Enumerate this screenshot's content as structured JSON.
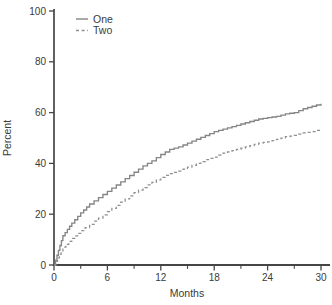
{
  "figure": {
    "ylabel": "Percent",
    "xlabel": "Months"
  },
  "colors": {
    "background": "#ffffff",
    "axis": "#454545",
    "text": "#3a3a3a",
    "series_one": "#858585",
    "series_two": "#8f8f8f"
  },
  "chart_data": {
    "type": "line",
    "title": "",
    "xlabel": "Months",
    "ylabel": "Percent",
    "xlim": [
      0,
      30
    ],
    "ylim": [
      0,
      100
    ],
    "xticks_major": [
      0,
      6,
      12,
      18,
      24,
      30
    ],
    "xticks_minor": [
      3,
      9,
      15,
      21,
      27
    ],
    "yticks": [
      0,
      20,
      40,
      60,
      80,
      100
    ],
    "grid": false,
    "legend_position": "top-left-inside",
    "curve_style": "step-cumulative",
    "x": [
      0,
      1,
      2,
      3,
      4,
      5,
      6,
      7,
      8,
      9,
      10,
      11,
      12,
      13,
      14,
      15,
      16,
      17,
      18,
      19,
      20,
      21,
      22,
      23,
      24,
      25,
      26,
      27,
      28,
      29,
      30
    ],
    "series": [
      {
        "name": "One",
        "style": "solid",
        "color": "#858585",
        "values": [
          0,
          11.5,
          16.5,
          20.5,
          24,
          26.5,
          29,
          31.5,
          34,
          36.5,
          39,
          41,
          43.5,
          45.5,
          46.5,
          48,
          49.5,
          51,
          52.5,
          53.5,
          54.5,
          55.5,
          56.5,
          57.5,
          58,
          58.5,
          59.5,
          60,
          61.5,
          62.5,
          63.5
        ]
      },
      {
        "name": "Two",
        "style": "dashed",
        "color": "#8f8f8f",
        "values": [
          0,
          7,
          10.5,
          13.5,
          16,
          18.5,
          21,
          23.5,
          26,
          28.5,
          30.5,
          32.5,
          34.5,
          36,
          37,
          38.5,
          40,
          41.5,
          42.5,
          44,
          45,
          46,
          47,
          48,
          48.5,
          49.5,
          50.5,
          51,
          52,
          52.5,
          53.5
        ]
      }
    ]
  }
}
